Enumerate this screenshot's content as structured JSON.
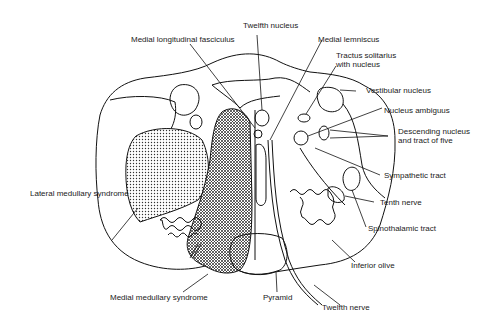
{
  "diagram": {
    "colors": {
      "line": "#111111",
      "text": "#222222",
      "background": "#ffffff"
    },
    "labels": {
      "twelfth_nucleus": "Twelfth nucleus",
      "medial_longitudinal_fasciculus": "Medial longitudinal fasciculus",
      "medial_lemniscus": "Medial lemniscus",
      "tractus_solitarius_1": "Tractus solitarius",
      "tractus_solitarius_2": "with nucleus",
      "vestibular_nucleus": "Vestibular nucleus",
      "nucleus_ambiguus": "Nucleus ambiguus",
      "descending_nucleus_1": "Descending nucleus",
      "descending_nucleus_2": "and tract of five",
      "sympathetic_tract": "Sympathetic tract",
      "tenth_nerve": "Tenth nerve",
      "spinothalamic_tract": "Spinothalamic tract",
      "inferior_olive": "Inferior olive",
      "twelfth_nerve": "Twelfth nerve",
      "pyramid": "Pyramid",
      "medial_medullary_syndrome": "Medial medullary syndrome",
      "lateral_medullary_syndrome": "Lateral medullary syndrome"
    }
  }
}
